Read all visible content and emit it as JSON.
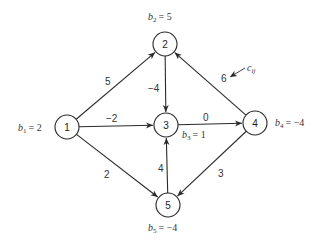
{
  "diagram": {
    "type": "network-flow",
    "nodes": [
      {
        "id": "1",
        "label": "1",
        "x": 67,
        "y": 127,
        "supply_label": "b",
        "supply_sub": "1",
        "supply_value": "= 2",
        "sx": 18,
        "sy": 131
      },
      {
        "id": "2",
        "label": "2",
        "x": 165,
        "y": 44,
        "supply_label": "b",
        "supply_sub": "2",
        "supply_value": "= 5",
        "sx": 148,
        "sy": 20
      },
      {
        "id": "3",
        "label": "3",
        "x": 166,
        "y": 125,
        "supply_label": "b",
        "supply_sub": "3",
        "supply_value": "= 1",
        "sx": 182,
        "sy": 138
      },
      {
        "id": "4",
        "label": "4",
        "x": 255,
        "y": 123,
        "supply_label": "b",
        "supply_sub": "4",
        "supply_value": "= −4",
        "sx": 275,
        "sy": 126
      },
      {
        "id": "5",
        "label": "5",
        "x": 168,
        "y": 205,
        "supply_label": "b",
        "supply_sub": "5",
        "supply_value": "= −4",
        "sx": 148,
        "sy": 231
      }
    ],
    "edges": [
      {
        "from": "1",
        "to": "2",
        "cost": "5",
        "lx": 105,
        "ly": 85
      },
      {
        "from": "1",
        "to": "3",
        "cost": "−2",
        "lx": 106,
        "ly": 122
      },
      {
        "from": "1",
        "to": "5",
        "cost": "2",
        "lx": 104,
        "ly": 178
      },
      {
        "from": "2",
        "to": "3",
        "cost": "−4",
        "lx": 148,
        "ly": 92
      },
      {
        "from": "3",
        "to": "4",
        "cost": "0",
        "lx": 203,
        "ly": 121
      },
      {
        "from": "4",
        "to": "2",
        "cost": "6",
        "lx": 221,
        "ly": 82
      },
      {
        "from": "4",
        "to": "5",
        "cost": "3",
        "lx": 218,
        "ly": 177
      },
      {
        "from": "5",
        "to": "3",
        "cost": "4",
        "lx": 158,
        "ly": 172
      }
    ],
    "annotation": {
      "label": "c",
      "sub": "ij",
      "x": 247,
      "y": 71,
      "arrow_from": [
        245,
        68
      ],
      "arrow_to": [
        230,
        77
      ]
    }
  }
}
